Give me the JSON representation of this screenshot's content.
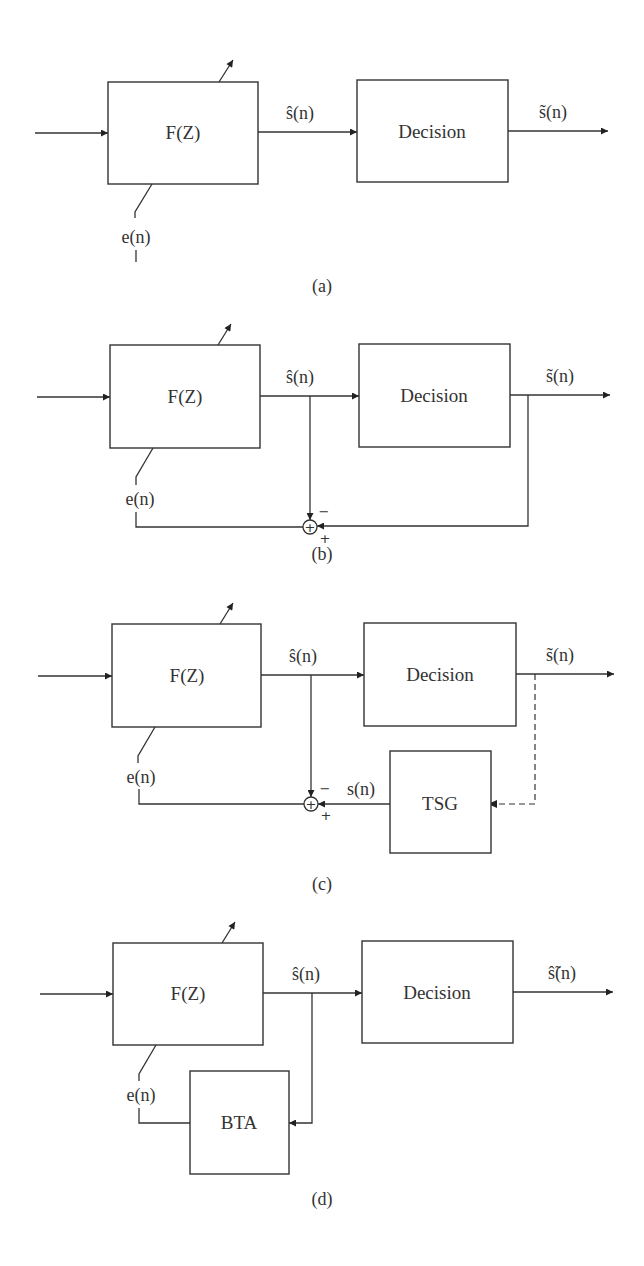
{
  "figure": {
    "panels": [
      {
        "id": "a",
        "caption": "(a)",
        "filter_label": "F(Z)",
        "decision_label": "Decision",
        "filter_output_label": "ŝ(n)",
        "decision_output_label": "s̃(n)",
        "error_label": "e(n)"
      },
      {
        "id": "b",
        "caption": "(b)",
        "filter_label": "F(Z)",
        "decision_label": "Decision",
        "filter_output_label": "ŝ(n)",
        "decision_output_label": "s̃(n)",
        "error_label": "e(n)",
        "summer_symbol": "+",
        "summer_minus": "−",
        "summer_plus": "+"
      },
      {
        "id": "c",
        "caption": "(c)",
        "filter_label": "F(Z)",
        "decision_label": "Decision",
        "filter_output_label": "ŝ(n)",
        "decision_output_label": "s̃(n)",
        "error_label": "e(n)",
        "training_label": "TSG",
        "training_output_label": "s(n)",
        "summer_symbol": "+",
        "summer_minus": "−",
        "summer_plus": "+"
      },
      {
        "id": "d",
        "caption": "(d)",
        "filter_label": "F(Z)",
        "decision_label": "Decision",
        "filter_output_label": "ŝ(n)",
        "decision_output_label": "ŝ̃(n)",
        "error_label": "e(n)",
        "blind_label": "BTA"
      }
    ],
    "stroke_color": "#333333",
    "background": "#ffffff"
  }
}
